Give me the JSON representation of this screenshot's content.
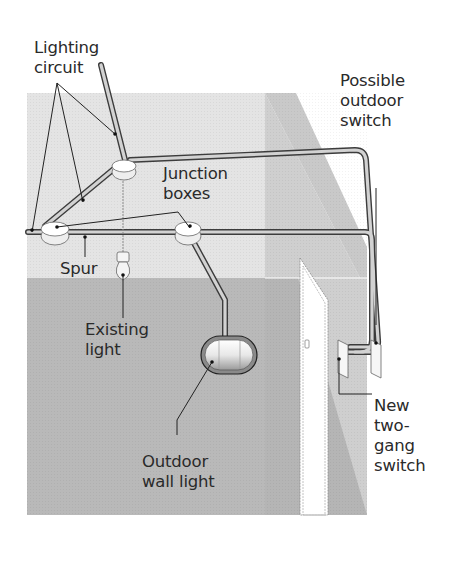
{
  "diagram": {
    "colors": {
      "ceiling": "#e6e6e6",
      "back_wall_lower": "#b9b9b9",
      "side_wall_upper": "#cdcdcd",
      "side_wall_lower": "#bcbcbc",
      "cable": "#d0d0d0",
      "cable_edge": "#444444",
      "leader": "#222222",
      "text": "#2a2a2a"
    },
    "labels": {
      "lighting_circuit": "Lighting\ncircuit",
      "junction_boxes": "Junction\nboxes",
      "spur": "Spur",
      "existing_light": "Existing\nlight",
      "outdoor_wall_light": "Outdoor\nwall light",
      "possible_outdoor_switch": "Possible\noutdoor\nswitch",
      "new_two_gang_switch": "New\ntwo-\ngang\nswitch"
    }
  }
}
